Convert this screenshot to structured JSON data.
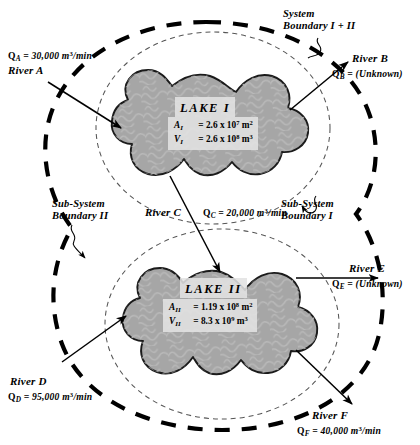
{
  "diagram": {
    "boundaries": {
      "outer": {
        "label_line1": "System",
        "label_line2": "Boundary I + II",
        "style": "thick-dashed"
      },
      "sub_i": {
        "label_line1": "Sub-System",
        "label_line2": "Boundary I",
        "style": "thin-dashed"
      },
      "sub_ii": {
        "label_line1": "Sub-System",
        "label_line2": "Boundary II",
        "style": "thin-dashed"
      }
    },
    "lakes": [
      {
        "id": "lake-1",
        "name": "LAKE I",
        "area_symbol": "A",
        "area_subscript": "I",
        "area_value": "= 2.6  x  10",
        "area_exp": "7",
        "area_unit": "m",
        "area_unit_exp": "2",
        "volume_symbol": "V",
        "volume_subscript": "I",
        "volume_value": "=  2.6  x  10",
        "volume_exp": "8",
        "volume_unit": "m",
        "volume_unit_exp": "3"
      },
      {
        "id": "lake-2",
        "name": "LAKE II",
        "area_symbol": "A",
        "area_subscript": "II",
        "area_value": "= 1.19  x  10",
        "area_exp": "8",
        "area_unit": "m",
        "area_unit_exp": "2",
        "volume_symbol": "V",
        "volume_subscript": "II",
        "volume_value": "=  8.3   x  10",
        "volume_exp": "9",
        "volume_unit": "m",
        "volume_unit_exp": "3"
      }
    ],
    "rivers": [
      {
        "id": "river-a",
        "name": "River A",
        "flow_symbol": "Q",
        "flow_subscript": "A",
        "flow_eq": "= 30,000  m",
        "flow_exp": "3",
        "flow_rate_unit": "/min",
        "direction": "inflow",
        "target": "LAKE I"
      },
      {
        "id": "river-b",
        "name": "River B",
        "flow_symbol": "Q",
        "flow_subscript": "B",
        "flow_eq": "= (Unknown)",
        "flow_exp": "",
        "flow_rate_unit": "",
        "direction": "outflow",
        "target": "LAKE I"
      },
      {
        "id": "river-c",
        "name": "River C",
        "flow_symbol": "Q",
        "flow_subscript": "C",
        "flow_eq": "= 20,000  m",
        "flow_exp": "3",
        "flow_rate_unit": "/min",
        "direction": "interconnect",
        "target": "LAKE I to LAKE II"
      },
      {
        "id": "river-d",
        "name": "River D",
        "flow_symbol": "Q",
        "flow_subscript": "D",
        "flow_eq": "= 95,000  m",
        "flow_exp": "3",
        "flow_rate_unit": "/min",
        "direction": "inflow",
        "target": "LAKE II"
      },
      {
        "id": "river-e",
        "name": "River E",
        "flow_symbol": "Q",
        "flow_subscript": "E",
        "flow_eq": "= (Unknown)",
        "flow_exp": "",
        "flow_rate_unit": "",
        "direction": "outflow",
        "target": "LAKE II"
      },
      {
        "id": "river-f",
        "name": "River F",
        "flow_symbol": "Q",
        "flow_subscript": "F",
        "flow_eq": "= 40,000  m",
        "flow_exp": "3",
        "flow_rate_unit": "/min",
        "direction": "outflow",
        "target": "LAKE II"
      }
    ],
    "colors": {
      "lake_fill": "#a6a6a6",
      "lake_stroke": "#1a1a1a",
      "boundary": "#000000",
      "background": "#ffffff",
      "label_box": "#e2e2e2"
    }
  }
}
